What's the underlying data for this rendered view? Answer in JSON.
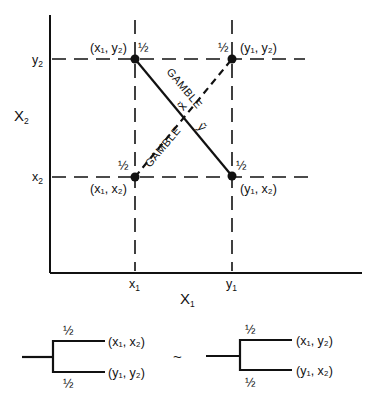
{
  "diagram": {
    "axes": {
      "x_label": "X",
      "x_label_sub": "1",
      "y_label": "X",
      "y_label_sub": "2",
      "x_ticks": [
        {
          "base": "x",
          "sub": "1"
        },
        {
          "base": "y",
          "sub": "1"
        }
      ],
      "y_ticks": [
        {
          "base": "y",
          "sub": "2"
        },
        {
          "base": "x",
          "sub": "2"
        }
      ]
    },
    "points": [
      {
        "id": "x1y2",
        "label": "(x₁, y₂)",
        "prob": "½"
      },
      {
        "id": "y1y2",
        "label": "(y₁, y₂)",
        "prob": "½"
      },
      {
        "id": "x1x2",
        "label": "(x₁, x₂)",
        "prob": "½"
      },
      {
        "id": "y1x2",
        "label": "(y₁, x₂)",
        "prob": "½"
      }
    ],
    "gambles": [
      {
        "name": "GAMBLE",
        "symbol": "ỹ",
        "line": "solid",
        "from": "x1y2",
        "to": "y1x2"
      },
      {
        "name": "GAMBLE",
        "symbol": "x̃",
        "line": "dashed",
        "from": "x1x2",
        "to": "y1y2"
      }
    ],
    "trees": {
      "left": {
        "top_prob": "½",
        "top_outcome": "(x₁, x₂)",
        "bottom_prob": "½",
        "bottom_outcome": "(y₁, y₂)"
      },
      "relation": "~",
      "right": {
        "top_prob": "½",
        "top_outcome": "(x₁, y₂)",
        "bottom_prob": "½",
        "bottom_outcome": "(y₁, x₂)"
      }
    },
    "colors": {
      "ink": "#111111",
      "background": "#ffffff"
    }
  }
}
